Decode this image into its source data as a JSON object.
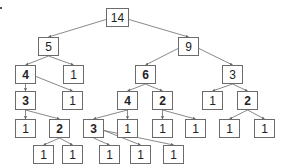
{
  "diagram": {
    "type": "tree",
    "edge_color": "#6b6b6b",
    "nodes": [
      {
        "id": "n0",
        "label": "14",
        "x": 106,
        "y": 8,
        "bold": false,
        "wide": true
      },
      {
        "id": "n1",
        "label": "5",
        "x": 38,
        "y": 37,
        "bold": false
      },
      {
        "id": "n2",
        "label": "9",
        "x": 178,
        "y": 37,
        "bold": false
      },
      {
        "id": "n3",
        "label": "4",
        "x": 15,
        "y": 65,
        "bold": true
      },
      {
        "id": "n4",
        "label": "1",
        "x": 63,
        "y": 65,
        "bold": false
      },
      {
        "id": "n5",
        "label": "6",
        "x": 135,
        "y": 65,
        "bold": true
      },
      {
        "id": "n6",
        "label": "3",
        "x": 222,
        "y": 65,
        "bold": false
      },
      {
        "id": "n7",
        "label": "3",
        "x": 15,
        "y": 91,
        "bold": true
      },
      {
        "id": "n8",
        "label": "1",
        "x": 62,
        "y": 91,
        "bold": false
      },
      {
        "id": "n9",
        "label": "4",
        "x": 117,
        "y": 91,
        "bold": true
      },
      {
        "id": "n10",
        "label": "2",
        "x": 152,
        "y": 91,
        "bold": true
      },
      {
        "id": "n11",
        "label": "1",
        "x": 202,
        "y": 91,
        "bold": false
      },
      {
        "id": "n12",
        "label": "2",
        "x": 237,
        "y": 91,
        "bold": true
      },
      {
        "id": "n13",
        "label": "1",
        "x": 15,
        "y": 119,
        "bold": false
      },
      {
        "id": "n14",
        "label": "2",
        "x": 49,
        "y": 119,
        "bold": true
      },
      {
        "id": "n15",
        "label": "3",
        "x": 83,
        "y": 119,
        "bold": true
      },
      {
        "id": "n16",
        "label": "1",
        "x": 117,
        "y": 119,
        "bold": false
      },
      {
        "id": "n17",
        "label": "1",
        "x": 152,
        "y": 119,
        "bold": false
      },
      {
        "id": "n18",
        "label": "1",
        "x": 185,
        "y": 119,
        "bold": false
      },
      {
        "id": "n19",
        "label": "1",
        "x": 219,
        "y": 119,
        "bold": false
      },
      {
        "id": "n20",
        "label": "1",
        "x": 254,
        "y": 119,
        "bold": false
      },
      {
        "id": "n21",
        "label": "1",
        "x": 33,
        "y": 145,
        "bold": false
      },
      {
        "id": "n22",
        "label": "1",
        "x": 62,
        "y": 145,
        "bold": false
      },
      {
        "id": "n23",
        "label": "1",
        "x": 99,
        "y": 145,
        "bold": false
      },
      {
        "id": "n24",
        "label": "1",
        "x": 130,
        "y": 145,
        "bold": false
      },
      {
        "id": "n25",
        "label": "1",
        "x": 163,
        "y": 145,
        "bold": false
      }
    ],
    "edges": [
      [
        "n0",
        "n1"
      ],
      [
        "n0",
        "n2"
      ],
      [
        "n1",
        "n3"
      ],
      [
        "n1",
        "n4"
      ],
      [
        "n2",
        "n5"
      ],
      [
        "n2",
        "n6"
      ],
      [
        "n3",
        "n7"
      ],
      [
        "n3",
        "n8"
      ],
      [
        "n5",
        "n9"
      ],
      [
        "n5",
        "n10"
      ],
      [
        "n6",
        "n11"
      ],
      [
        "n6",
        "n12"
      ],
      [
        "n7",
        "n13"
      ],
      [
        "n7",
        "n14"
      ],
      [
        "n9",
        "n15"
      ],
      [
        "n9",
        "n16"
      ],
      [
        "n10",
        "n17"
      ],
      [
        "n10",
        "n18"
      ],
      [
        "n12",
        "n19"
      ],
      [
        "n12",
        "n20"
      ],
      [
        "n14",
        "n21"
      ],
      [
        "n14",
        "n22"
      ],
      [
        "n15",
        "n23"
      ],
      [
        "n15",
        "n24"
      ],
      [
        "n15",
        "n25"
      ]
    ]
  }
}
